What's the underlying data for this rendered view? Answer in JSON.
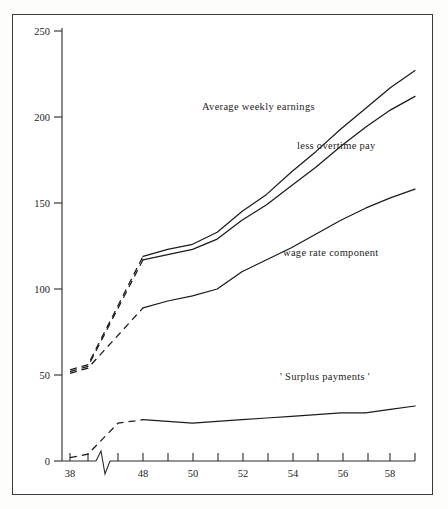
{
  "chart_data": {
    "type": "line",
    "title": "",
    "subtitle": "",
    "xlabel": "",
    "ylabel": "",
    "xlim": [
      38,
      59
    ],
    "ylim": [
      0,
      250
    ],
    "grid": false,
    "legend_position": "inline-annotations",
    "axis_break": {
      "present": true,
      "between": [
        39,
        47
      ],
      "style": "zigzag-on-x-axis"
    },
    "yticks": [
      0,
      50,
      100,
      150,
      200,
      250
    ],
    "ytick_labels": [
      "0",
      "50",
      "100",
      "150",
      "200",
      "250"
    ],
    "xticks": [
      38,
      39,
      47,
      48,
      49,
      50,
      51,
      52,
      53,
      54,
      55,
      56,
      57,
      58,
      59
    ],
    "xtick_labels": [
      "38",
      "48",
      "50",
      "52",
      "54",
      "56",
      "58"
    ],
    "labelled_xticks": [
      38,
      48,
      50,
      52,
      54,
      56,
      58
    ],
    "series": [
      {
        "name": "Average weekly earnings",
        "label": "Average weekly earnings",
        "x": [
          38,
          39,
          48,
          49,
          50,
          51,
          52,
          53,
          54,
          55,
          56,
          57,
          58,
          59
        ],
        "values": [
          53,
          56,
          119,
          123,
          126,
          133,
          145,
          155,
          168,
          180,
          193,
          205,
          217,
          227
        ],
        "dashed_segment_x": [
          38,
          48
        ],
        "style": "solid-with-dashed-start"
      },
      {
        "name": "less overtime pay",
        "label": "less overtime pay",
        "x": [
          38,
          39,
          48,
          49,
          50,
          51,
          52,
          53,
          54,
          55,
          56,
          57,
          58,
          59
        ],
        "values": [
          52,
          55,
          117,
          120,
          123,
          129,
          140,
          149,
          160,
          171,
          183,
          194,
          204,
          212
        ],
        "dashed_segment_x": [
          38,
          48
        ],
        "style": "solid-with-dashed-start"
      },
      {
        "name": "wage rate component",
        "label": "wage rate component",
        "x": [
          38,
          39,
          48,
          49,
          50,
          51,
          52,
          53,
          54,
          55,
          56,
          57,
          58,
          59
        ],
        "values": [
          51,
          54,
          89,
          93,
          96,
          100,
          110,
          117,
          124,
          132,
          140,
          147,
          153,
          158
        ],
        "dashed_segment_x": [
          38,
          48
        ],
        "style": "solid-with-dashed-start"
      },
      {
        "name": "'Surplus payments'",
        "label": "' Surplus payments '",
        "x": [
          38,
          39,
          47,
          48,
          49,
          50,
          51,
          52,
          53,
          54,
          55,
          56,
          57,
          58,
          59
        ],
        "values": [
          2,
          4,
          22,
          24,
          23,
          22,
          23,
          24,
          25,
          26,
          27,
          28,
          28,
          30,
          32
        ],
        "dashed_segment_x": [
          38,
          48
        ],
        "style": "solid-with-dashed-start"
      }
    ],
    "annotations": [
      {
        "text": "Average weekly earnings",
        "x_px": 202,
        "y_px": 108
      },
      {
        "text": "less overtime pay",
        "x_px": 297,
        "y_px": 147
      },
      {
        "text": "wage rate component",
        "x_px": 283,
        "y_px": 254
      },
      {
        "text": "' Surplus payments '",
        "x_px": 280,
        "y_px": 378
      }
    ],
    "colors": {
      "line": "#1b1b1b",
      "axis": "#2b2b2b",
      "background": "#ffffff",
      "frame": "#3a3a3a"
    }
  }
}
